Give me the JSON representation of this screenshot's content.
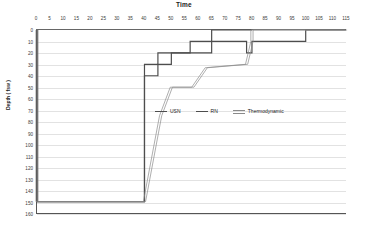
{
  "chart_data": {
    "type": "line",
    "title": "Time",
    "xlabel": "Time",
    "ylabel": "Depth ( fsw )",
    "xlim": [
      0,
      115
    ],
    "ylim": [
      0,
      160
    ],
    "y_inverted": true,
    "grid": true,
    "legend_position": "center",
    "xticks": [
      0,
      5,
      10,
      15,
      20,
      25,
      30,
      35,
      40,
      45,
      50,
      55,
      60,
      65,
      70,
      75,
      80,
      85,
      90,
      95,
      100,
      105,
      110,
      115
    ],
    "yticks": [
      0,
      10,
      20,
      30,
      40,
      50,
      60,
      70,
      80,
      90,
      100,
      110,
      120,
      130,
      140,
      150,
      160
    ],
    "series": [
      {
        "name": "USN",
        "color": "#4d4d4d",
        "style": "step",
        "points": [
          [
            0,
            0
          ],
          [
            0,
            150
          ],
          [
            40,
            150
          ],
          [
            40,
            30
          ],
          [
            45,
            30
          ],
          [
            45,
            20
          ],
          [
            57,
            20
          ],
          [
            57,
            10
          ],
          [
            65,
            10
          ],
          [
            65,
            0
          ],
          [
            80,
            0
          ]
        ]
      },
      {
        "name": "RN",
        "color": "#4d4d4d",
        "style": "step",
        "points": [
          [
            0,
            0
          ],
          [
            0,
            150
          ],
          [
            40,
            150
          ],
          [
            40,
            40
          ],
          [
            45,
            40
          ],
          [
            45,
            30
          ],
          [
            50,
            30
          ],
          [
            50,
            20
          ],
          [
            65,
            20
          ],
          [
            65,
            10
          ],
          [
            78,
            10
          ],
          [
            78,
            20
          ],
          [
            80,
            20
          ],
          [
            80,
            10
          ],
          [
            100,
            10
          ],
          [
            100,
            0
          ],
          [
            115,
            0
          ]
        ]
      },
      {
        "name": "Thermodynamic",
        "color": "#8a8a8a",
        "style": "double-line",
        "points": [
          [
            0,
            0
          ],
          [
            0,
            150
          ],
          [
            40,
            150
          ],
          [
            46,
            75
          ],
          [
            50,
            50
          ],
          [
            58,
            50
          ],
          [
            63,
            33
          ],
          [
            78,
            30
          ],
          [
            80,
            10
          ],
          [
            80,
            0
          ],
          [
            115,
            0
          ]
        ]
      }
    ]
  },
  "legend": {
    "items": [
      {
        "label": "USN"
      },
      {
        "label": "RN"
      },
      {
        "label": "Thermodynamic"
      }
    ]
  }
}
